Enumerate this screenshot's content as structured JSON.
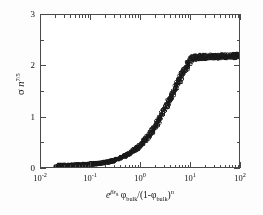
{
  "chart_data": {
    "type": "scatter",
    "title": "",
    "xlabel": "e^(βεs) φ_bulk/(1-φ_bulk)^n",
    "ylabel": "σ n^(7/5)",
    "xscale": "log",
    "yscale": "linear",
    "xlim": [
      0.01,
      100
    ],
    "ylim": [
      0,
      3
    ],
    "grid": false,
    "legend": null,
    "xticks": [
      {
        "value": 0.01,
        "label": "10",
        "exp": "-2"
      },
      {
        "value": 0.1,
        "label": "10",
        "exp": "-1"
      },
      {
        "value": 1,
        "label": "10",
        "exp": "0"
      },
      {
        "value": 10,
        "label": "10",
        "exp": "1"
      },
      {
        "value": 100,
        "label": "10",
        "exp": "2"
      }
    ],
    "yticks": [
      {
        "value": 0,
        "label": "0"
      },
      {
        "value": 1,
        "label": "1"
      },
      {
        "value": 2,
        "label": "2"
      },
      {
        "value": 3,
        "label": "3"
      }
    ],
    "yminor": [
      0.5,
      1.5,
      2.5
    ],
    "marker": "open-circle",
    "marker_color": "#1a1a1a",
    "marker_size": 3.1,
    "series": [
      {
        "name": "collapsed master curve",
        "x": [
          0.021,
          0.023,
          0.025,
          0.027,
          0.029,
          0.031,
          0.034,
          0.036,
          0.039,
          0.042,
          0.045,
          0.049,
          0.053,
          0.057,
          0.061,
          0.066,
          0.071,
          0.077,
          0.083,
          0.089,
          0.096,
          0.104,
          0.112,
          0.121,
          0.13,
          0.14,
          0.151,
          0.163,
          0.176,
          0.19,
          0.205,
          0.221,
          0.238,
          0.257,
          0.277,
          0.299,
          0.322,
          0.348,
          0.375,
          0.404,
          0.436,
          0.47,
          0.507,
          0.547,
          0.59,
          0.636,
          0.686,
          0.74,
          0.798,
          0.861,
          0.928,
          1.001,
          1.08,
          1.165,
          1.256,
          1.355,
          1.461,
          1.576,
          1.7,
          1.834,
          1.978,
          2.133,
          2.301,
          2.482,
          2.677,
          2.887,
          3.114,
          3.359,
          3.623,
          3.908,
          4.215,
          4.547,
          4.904,
          5.29,
          5.706,
          6.155,
          6.639,
          7.161,
          7.724,
          8.332,
          8.987,
          9.694,
          10.46,
          11.28,
          12.17,
          13.13,
          14.16,
          15.27,
          16.47,
          17.77,
          19.16,
          20.67,
          22.29,
          24.05,
          25.94,
          27.98,
          30.18,
          32.55,
          35.11,
          37.87,
          40.85,
          44.06,
          47.53,
          51.26,
          55.29,
          59.64,
          64.33,
          69.38,
          74.84,
          80.72,
          87.07,
          93.92,
          100.0
        ],
        "y": [
          0.012,
          0.013,
          0.014,
          0.015,
          0.016,
          0.017,
          0.018,
          0.019,
          0.021,
          0.022,
          0.024,
          0.025,
          0.027,
          0.029,
          0.031,
          0.033,
          0.036,
          0.038,
          0.041,
          0.044,
          0.047,
          0.05,
          0.054,
          0.058,
          0.062,
          0.067,
          0.071,
          0.077,
          0.082,
          0.088,
          0.095,
          0.102,
          0.109,
          0.117,
          0.126,
          0.135,
          0.145,
          0.156,
          0.168,
          0.18,
          0.194,
          0.208,
          0.224,
          0.241,
          0.259,
          0.278,
          0.299,
          0.321,
          0.345,
          0.371,
          0.398,
          0.427,
          0.458,
          0.491,
          0.526,
          0.563,
          0.602,
          0.644,
          0.688,
          0.734,
          0.782,
          0.833,
          0.886,
          0.941,
          0.998,
          1.057,
          1.118,
          1.181,
          1.245,
          1.31,
          1.376,
          1.442,
          1.509,
          1.576,
          1.642,
          1.707,
          1.771,
          1.833,
          1.893,
          1.95,
          2.004,
          2.054,
          2.1,
          2.13,
          2.15,
          2.16,
          2.165,
          2.168,
          2.17,
          2.172,
          2.173,
          2.174,
          2.175,
          2.176,
          2.177,
          2.178,
          2.179,
          2.18,
          2.181,
          2.182,
          2.183,
          2.184,
          2.185,
          2.186,
          2.187,
          2.188,
          2.189,
          2.19,
          2.191,
          2.192,
          2.193,
          2.194,
          2.195
        ],
        "scatter_band": 0.075
      }
    ]
  },
  "axis_titles": {
    "x": {
      "e": "e",
      "e_exp_beta": "βε",
      "e_exp_sub": "s",
      "phi1": "φ",
      "phi1_sub": "bulk",
      "slash": "/(1-",
      "phi2": "φ",
      "phi2_sub": "bulk",
      "close": ")",
      "n_exp": "n"
    },
    "y": {
      "sigma": "σ",
      "n": "n",
      "exp": "7/5"
    }
  }
}
